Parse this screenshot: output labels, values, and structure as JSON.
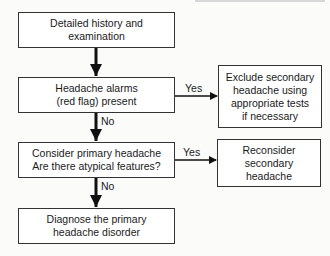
{
  "flowchart": {
    "nodes": [
      {
        "id": "history",
        "text": "Detailed history and\nexamination"
      },
      {
        "id": "alarms",
        "text": "Headache alarms\n(red flag) present"
      },
      {
        "id": "primary",
        "text": "Consider primary headache\nAre there atypical features?"
      },
      {
        "id": "diagnose",
        "text": "Diagnose the primary\nheadache disorder"
      },
      {
        "id": "exclude",
        "text": "Exclude secondary\nheadache using\nappropriate tests\nif necessary"
      },
      {
        "id": "reconsider",
        "text": "Reconsider\nsecondary\nheadache"
      }
    ],
    "edges": [
      {
        "from": "history",
        "to": "alarms",
        "label": ""
      },
      {
        "from": "alarms",
        "to": "exclude",
        "label": "Yes"
      },
      {
        "from": "alarms",
        "to": "primary",
        "label": "No"
      },
      {
        "from": "primary",
        "to": "reconsider",
        "label": "Yes"
      },
      {
        "from": "primary",
        "to": "diagnose",
        "label": "No"
      }
    ]
  }
}
